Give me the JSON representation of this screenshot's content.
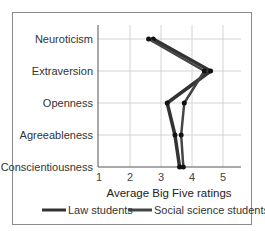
{
  "chart_data": {
    "type": "line",
    "orientation": "horizontal",
    "title": "",
    "xlabel": "Average Big Five ratings",
    "ylabel": "",
    "xlim": [
      1,
      5.6
    ],
    "xticks": [
      1,
      2,
      3,
      4,
      5
    ],
    "categories": [
      "Neuroticism",
      "Extraversion",
      "Openness",
      "Agreeableness",
      "Conscientiousness"
    ],
    "series": [
      {
        "name": "Law students",
        "color": "#333333",
        "values": [
          2.75,
          4.6,
          3.2,
          3.45,
          3.6
        ]
      },
      {
        "name": "Social science students",
        "color": "#444444",
        "values": [
          2.6,
          4.4,
          3.75,
          3.65,
          3.72
        ]
      }
    ],
    "grid": true,
    "legend_position": "bottom"
  },
  "axis": {
    "xlabel": "Average Big Five ratings",
    "ticks": [
      "1",
      "2",
      "3",
      "4",
      "5"
    ]
  },
  "categories": [
    "Neuroticism",
    "Extraversion",
    "Openness",
    "Agreeableness",
    "Conscientiousness"
  ],
  "legend": {
    "law": "Law students",
    "social": "Social science students"
  }
}
